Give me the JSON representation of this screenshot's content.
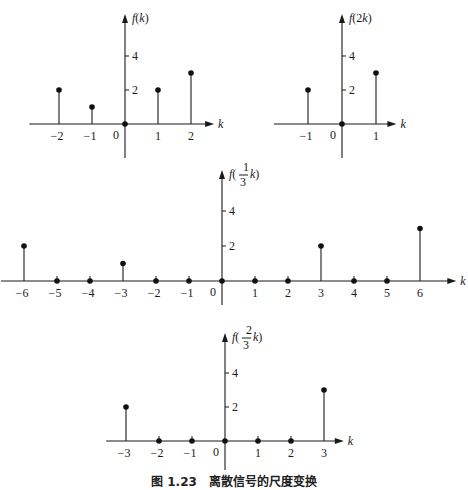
{
  "caption": "图 1.23　离散信号的尺度变换",
  "chart_data": [
    {
      "type": "stem",
      "title": "f(k)",
      "ylabel": "f(k)",
      "xlabel": "k",
      "x": [
        -2,
        -1,
        0,
        1,
        2
      ],
      "values": [
        2,
        1,
        0,
        2,
        3
      ],
      "x_tick_labels": [
        "-2",
        "-1",
        "1",
        "2"
      ],
      "y_ticks": [
        2,
        4
      ],
      "layout": {
        "ox": 125,
        "oy": 124,
        "kx": 33,
        "ky": 17,
        "xmin": -2.9,
        "xmax": 2.7,
        "ytop": 14,
        "ybot": 158
      }
    },
    {
      "type": "stem",
      "title": "f(2k)",
      "ylabel": "f(2k)",
      "xlabel": "k",
      "x": [
        -1,
        0,
        1
      ],
      "values": [
        2,
        0,
        3
      ],
      "x_tick_labels": [
        "-1",
        "1"
      ],
      "y_ticks": [
        2,
        4
      ],
      "layout": {
        "ox": 342,
        "oy": 124,
        "kx": 34,
        "ky": 17,
        "xmin": -2.0,
        "xmax": 1.6,
        "ytop": 14,
        "ybot": 158
      }
    },
    {
      "type": "stem",
      "title": "f(k/3)",
      "ylabel": "f(1/3 k)",
      "xlabel": "k",
      "x": [
        -6,
        -5,
        -4,
        -3,
        -2,
        -1,
        0,
        1,
        2,
        3,
        4,
        5,
        6
      ],
      "values": [
        2,
        0,
        0,
        1,
        0,
        0,
        0,
        0,
        0,
        2,
        0,
        0,
        3
      ],
      "x_tick_labels": [
        "-6",
        "-5",
        "-4",
        "-3",
        "-2",
        "-1",
        "1",
        "2",
        "3",
        "4",
        "5",
        "6"
      ],
      "y_ticks": [
        2,
        4
      ],
      "layout": {
        "ox": 222,
        "oy": 281,
        "kx": 33,
        "ky": 17.5,
        "xmin": -6.7,
        "xmax": 7.1,
        "ytop": 170,
        "ybot": 305
      }
    },
    {
      "type": "stem",
      "title": "f(2k/3)",
      "ylabel": "f(2/3 k)",
      "xlabel": "k",
      "x": [
        -3,
        -2,
        -1,
        0,
        1,
        2,
        3
      ],
      "values": [
        2,
        0,
        0,
        0,
        0,
        0,
        3
      ],
      "x_tick_labels": [
        "-3",
        "-2",
        "-1",
        "1",
        "2",
        "3"
      ],
      "y_ticks": [
        2,
        4
      ],
      "layout": {
        "ox": 225,
        "oy": 441,
        "kx": 33,
        "ky": 17,
        "xmin": -3.6,
        "xmax": 3.6,
        "ytop": 333,
        "ybot": 470
      }
    }
  ]
}
